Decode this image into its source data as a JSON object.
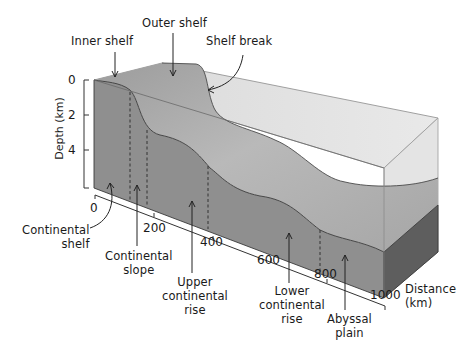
{
  "labels": {
    "inner_shelf": "Inner shelf",
    "outer_shelf": "Outer shelf",
    "shelf_break": "Shelf break",
    "continental_shelf": [
      "Continental",
      "shelf"
    ],
    "continental_slope": [
      "Continental",
      "slope"
    ],
    "upper_continental_rise": [
      "Upper",
      "continental",
      "rise"
    ],
    "lower_continental_rise": [
      "Lower",
      "continental",
      "rise"
    ],
    "abyssal_plain": [
      "Abyssal",
      "plain"
    ]
  },
  "axes": {
    "depth": {
      "label": "Depth (km)",
      "ticks": [
        "0",
        "2",
        "4"
      ]
    },
    "distance": {
      "label": [
        "Distance",
        "(km)"
      ],
      "ticks": [
        "0",
        "200",
        "400",
        "600",
        "800",
        "1000"
      ]
    }
  },
  "colors": {
    "water_top": "#dcdcdc",
    "water_side": "#e6e6e6",
    "seabed_surface": "#a8a8a8",
    "seabed_front": "#8f8f8f",
    "seabed_right": "#5e5e5e",
    "outline": "#3a3a3a"
  }
}
